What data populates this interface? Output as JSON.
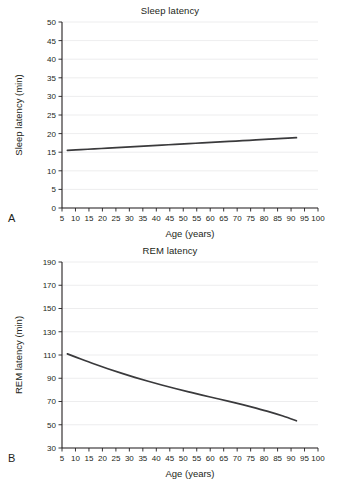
{
  "figure": {
    "background": "#ffffff",
    "line_color": "#3a3a3c",
    "axis_color": "#231f20",
    "grid_color": "#e8e8ea"
  },
  "panels": [
    {
      "letter": "A",
      "title": "Sleep latency",
      "xlabel": "Age (years)",
      "ylabel": "Sleep latency (min)"
    },
    {
      "letter": "B",
      "title": "REM latency",
      "xlabel": "Age (years)",
      "ylabel": "REM latency (min)"
    }
  ],
  "chart_data": [
    {
      "type": "line",
      "title": "Sleep latency",
      "panel": "A",
      "xlabel": "Age (years)",
      "ylabel": "Sleep latency (min)",
      "xlim": [
        5,
        100
      ],
      "ylim": [
        0,
        50
      ],
      "xticks": [
        5,
        10,
        15,
        20,
        25,
        30,
        35,
        40,
        45,
        50,
        55,
        60,
        65,
        70,
        75,
        80,
        85,
        90,
        95,
        100
      ],
      "yticks": [
        0,
        5,
        10,
        15,
        20,
        25,
        30,
        35,
        40,
        45,
        50
      ],
      "grid": "horizontal",
      "legend": "none",
      "series": [
        {
          "name": "Sleep latency",
          "x": [
            7,
            12,
            17,
            22,
            27,
            32,
            37,
            42,
            47,
            52,
            57,
            62,
            67,
            72,
            77,
            82,
            87,
            92
          ],
          "values": [
            15.5,
            15.7,
            15.9,
            16.1,
            16.3,
            16.5,
            16.7,
            16.9,
            17.1,
            17.3,
            17.5,
            17.7,
            17.9,
            18.1,
            18.3,
            18.5,
            18.7,
            18.9
          ]
        }
      ]
    },
    {
      "type": "line",
      "title": "REM latency",
      "panel": "B",
      "xlabel": "Age (years)",
      "ylabel": "REM latency (min)",
      "xlim": [
        5,
        100
      ],
      "ylim": [
        30,
        190
      ],
      "xticks": [
        5,
        10,
        15,
        20,
        25,
        30,
        35,
        40,
        45,
        50,
        55,
        60,
        65,
        70,
        75,
        80,
        85,
        90,
        95,
        100
      ],
      "yticks": [
        30,
        50,
        70,
        90,
        110,
        130,
        150,
        170,
        190
      ],
      "grid": "horizontal",
      "legend": "none",
      "series": [
        {
          "name": "REM latency",
          "x": [
            7,
            12,
            17,
            22,
            27,
            32,
            37,
            42,
            47,
            52,
            57,
            62,
            67,
            72,
            77,
            82,
            87,
            92
          ],
          "values": [
            111,
            106.5,
            102.2,
            98.2,
            94.4,
            90.8,
            87.4,
            84.2,
            81.2,
            78.3,
            75.5,
            72.8,
            70.1,
            67.3,
            64.3,
            61.1,
            57.5,
            53.4
          ]
        }
      ]
    }
  ]
}
